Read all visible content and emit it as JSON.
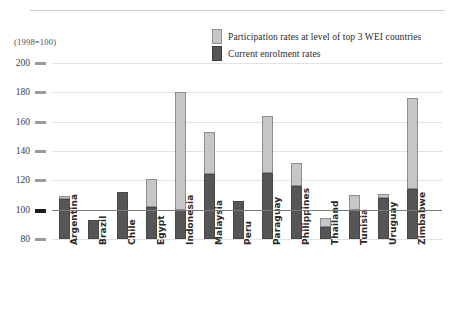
{
  "figure": {
    "base_note": "(1998=100)",
    "colors": {
      "light_fill": "#c6c6c6",
      "light_stroke": "#8d8d8d",
      "dark_fill": "#565656",
      "dark_stroke": "#474747",
      "gridline": "#e2e2e2",
      "index_line": "#7b7b7b"
    }
  },
  "legend": {
    "items": [
      {
        "label": "Participation rates at level of top 3 WEI countries",
        "swatch": "light"
      },
      {
        "label": "Current enrolment rates",
        "swatch": "dark"
      }
    ]
  },
  "chart_data": {
    "type": "bar",
    "title": "",
    "subtitle": "",
    "xlabel": "",
    "ylabel": "(1998=100)",
    "ylim": [
      80,
      200
    ],
    "yticks": [
      80,
      100,
      120,
      140,
      160,
      180,
      200
    ],
    "ytick_labels": [
      "80",
      "100",
      "120",
      "140",
      "160",
      "180",
      "200"
    ],
    "grid": true,
    "reference_line": 100,
    "stacked": true,
    "legend_position": "top-right",
    "categories": [
      "Argentina",
      "Brazil",
      "Chile",
      "Egypt",
      "Indonesia",
      "Malaysia",
      "Peru",
      "Paraguay",
      "Philippines",
      "Thailand",
      "Tunisia",
      "Uruguay",
      "Zimbabwe"
    ],
    "series": [
      {
        "name": "Current enrolment rates",
        "swatch": "dark",
        "values": [
          107,
          93,
          112,
          102,
          100,
          124,
          106,
          125,
          116,
          88,
          100,
          108,
          114
        ]
      },
      {
        "name": "Participation rates at level of top 3 WEI countries",
        "swatch": "light",
        "values": [
          109,
          93,
          112,
          121,
          180,
          153,
          106,
          164,
          132,
          94,
          110,
          111,
          176
        ]
      }
    ]
  }
}
